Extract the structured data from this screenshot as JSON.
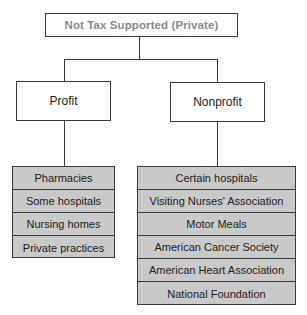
{
  "diagram": {
    "root": {
      "label": "Not Tax Supported (Private)"
    },
    "branches": [
      {
        "label": "Profit",
        "items": [
          "Pharmacies",
          "Some hospitals",
          "Nursing homes",
          "Private practices"
        ]
      },
      {
        "label": "Nonprofit",
        "items": [
          "Certain hospitals",
          "Visiting Nurses' Association",
          "Motor Meals",
          "American Cancer Society",
          "American Heart Association",
          "National Foundation"
        ]
      }
    ]
  },
  "colors": {
    "list_fill": "#c9c9c9",
    "root_text": "#8a8a8a",
    "border": "#3a3a3a"
  }
}
